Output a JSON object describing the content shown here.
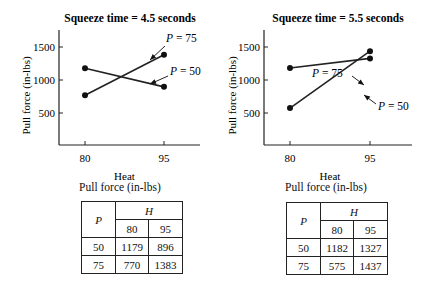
{
  "chart_data": [
    {
      "type": "line",
      "title": "Squeeze time = 4.5 seconds",
      "xlabel": "Heat",
      "ylabel": "Pull force (in-lbs)",
      "x": [
        80,
        95
      ],
      "x_tick_labels": [
        "80",
        "95"
      ],
      "y_tick_labels": [
        "500",
        "1000",
        "1500"
      ],
      "y_ticks": [
        500,
        1000,
        1500
      ],
      "ylim": [
        0,
        1750
      ],
      "series": [
        {
          "name": "P = 50",
          "values": [
            1179,
            896
          ]
        },
        {
          "name": "P = 75",
          "values": [
            770,
            1383
          ]
        }
      ],
      "annotations": [
        "P = 75",
        "P = 50"
      ],
      "table": {
        "caption": "Pull force (in-lbs)",
        "row_header": "P",
        "col_header": "H",
        "cols": [
          "80",
          "95"
        ],
        "rows": [
          {
            "label": "50",
            "values": [
              "1179",
              "896"
            ]
          },
          {
            "label": "75",
            "values": [
              "770",
              "1383"
            ]
          }
        ]
      }
    },
    {
      "type": "line",
      "title": "Squeeze time = 5.5 seconds",
      "xlabel": "Heat",
      "ylabel": "Pull force (in-lbs)",
      "x": [
        80,
        95
      ],
      "x_tick_labels": [
        "80",
        "95"
      ],
      "y_tick_labels": [
        "500",
        "1000",
        "1500"
      ],
      "y_ticks": [
        500,
        1000,
        1500
      ],
      "ylim": [
        0,
        1750
      ],
      "series": [
        {
          "name": "P = 50",
          "values": [
            1182,
            1327
          ]
        },
        {
          "name": "P = 75",
          "values": [
            575,
            1437
          ]
        }
      ],
      "annotations": [
        "P = 75",
        "P = 50"
      ],
      "table": {
        "caption": "Pull force (in-lbs)",
        "row_header": "P",
        "col_header": "H",
        "cols": [
          "80",
          "95"
        ],
        "rows": [
          {
            "label": "50",
            "values": [
              "1182",
              "1327"
            ]
          },
          {
            "label": "75",
            "values": [
              "575",
              "1437"
            ]
          }
        ]
      }
    }
  ]
}
